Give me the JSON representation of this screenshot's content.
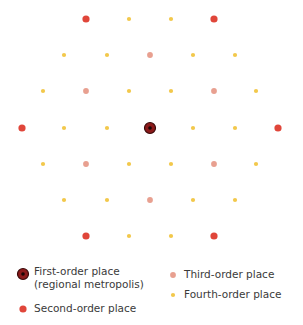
{
  "diagram": {
    "type": "central-place-hexagonal-lattice",
    "colors": {
      "first": "#8b1a1a",
      "first_ring": "#3a0a0a",
      "first_center": "#1a0505",
      "second": "#e0463a",
      "third": "#e8a090",
      "fourth": "#f2c84b"
    },
    "radii": {
      "first": 5.5,
      "second": 3.6,
      "third": 2.9,
      "fourth": 2.1
    },
    "places": [
      {
        "x": 86,
        "y": 19,
        "order": "second"
      },
      {
        "x": 129,
        "y": 19,
        "order": "fourth"
      },
      {
        "x": 171,
        "y": 19,
        "order": "fourth"
      },
      {
        "x": 214,
        "y": 19,
        "order": "second"
      },
      {
        "x": 64,
        "y": 55,
        "order": "fourth"
      },
      {
        "x": 107,
        "y": 55,
        "order": "fourth"
      },
      {
        "x": 150,
        "y": 55,
        "order": "third"
      },
      {
        "x": 193,
        "y": 55,
        "order": "fourth"
      },
      {
        "x": 235,
        "y": 55,
        "order": "fourth"
      },
      {
        "x": 43,
        "y": 91,
        "order": "fourth"
      },
      {
        "x": 86,
        "y": 91,
        "order": "third"
      },
      {
        "x": 129,
        "y": 91,
        "order": "fourth"
      },
      {
        "x": 171,
        "y": 91,
        "order": "fourth"
      },
      {
        "x": 214,
        "y": 91,
        "order": "third"
      },
      {
        "x": 256,
        "y": 91,
        "order": "fourth"
      },
      {
        "x": 22,
        "y": 128,
        "order": "second"
      },
      {
        "x": 64,
        "y": 128,
        "order": "fourth"
      },
      {
        "x": 107,
        "y": 128,
        "order": "fourth"
      },
      {
        "x": 150,
        "y": 128,
        "order": "first"
      },
      {
        "x": 193,
        "y": 128,
        "order": "fourth"
      },
      {
        "x": 235,
        "y": 128,
        "order": "fourth"
      },
      {
        "x": 278,
        "y": 128,
        "order": "second"
      },
      {
        "x": 43,
        "y": 164,
        "order": "fourth"
      },
      {
        "x": 86,
        "y": 164,
        "order": "third"
      },
      {
        "x": 129,
        "y": 164,
        "order": "fourth"
      },
      {
        "x": 171,
        "y": 164,
        "order": "fourth"
      },
      {
        "x": 214,
        "y": 164,
        "order": "third"
      },
      {
        "x": 256,
        "y": 164,
        "order": "fourth"
      },
      {
        "x": 64,
        "y": 200,
        "order": "fourth"
      },
      {
        "x": 107,
        "y": 200,
        "order": "fourth"
      },
      {
        "x": 150,
        "y": 200,
        "order": "third"
      },
      {
        "x": 193,
        "y": 200,
        "order": "fourth"
      },
      {
        "x": 235,
        "y": 200,
        "order": "fourth"
      },
      {
        "x": 86,
        "y": 236,
        "order": "second"
      },
      {
        "x": 129,
        "y": 236,
        "order": "fourth"
      },
      {
        "x": 171,
        "y": 236,
        "order": "fourth"
      },
      {
        "x": 214,
        "y": 236,
        "order": "second"
      }
    ]
  },
  "legend": {
    "first": {
      "line1": "First-order place",
      "line2": "(regional metropolis)"
    },
    "second": {
      "label": "Second-order place"
    },
    "third": {
      "label": "Third-order place"
    },
    "fourth": {
      "label": "Fourth-order place"
    }
  }
}
